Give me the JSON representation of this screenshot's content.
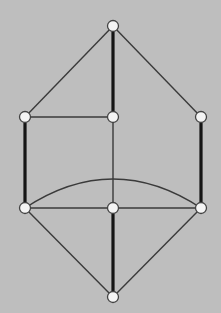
{
  "diagram": {
    "type": "graph",
    "background": "#bebebe",
    "node_radius": 5.5,
    "nodes": [
      {
        "id": "top",
        "x": 113,
        "y": 26
      },
      {
        "id": "left_mid",
        "x": 25,
        "y": 117
      },
      {
        "id": "center_mid",
        "x": 113,
        "y": 117
      },
      {
        "id": "right_mid",
        "x": 201,
        "y": 117
      },
      {
        "id": "left_low",
        "x": 25,
        "y": 208
      },
      {
        "id": "center_low",
        "x": 113,
        "y": 208
      },
      {
        "id": "right_low",
        "x": 201,
        "y": 208
      },
      {
        "id": "bottom",
        "x": 113,
        "y": 297
      }
    ],
    "edges": [
      {
        "from": "top",
        "to": "left_mid",
        "weight": "thin"
      },
      {
        "from": "top",
        "to": "right_mid",
        "weight": "thin"
      },
      {
        "from": "top",
        "to": "center_mid",
        "weight": "thick"
      },
      {
        "from": "left_mid",
        "to": "center_mid",
        "weight": "thin"
      },
      {
        "from": "center_mid",
        "to": "center_low",
        "weight": "thin"
      },
      {
        "from": "left_mid",
        "to": "left_low",
        "weight": "thick"
      },
      {
        "from": "right_mid",
        "to": "right_low",
        "weight": "thick"
      },
      {
        "from": "left_low",
        "to": "center_low",
        "weight": "thin"
      },
      {
        "from": "center_low",
        "to": "right_low",
        "weight": "thin"
      },
      {
        "from": "left_low",
        "to": "bottom",
        "weight": "thin"
      },
      {
        "from": "right_low",
        "to": "bottom",
        "weight": "thin"
      },
      {
        "from": "center_low",
        "to": "bottom",
        "weight": "thick"
      }
    ],
    "arcs": [
      {
        "from": "left_low",
        "to": "right_low",
        "peak_y": 179,
        "weight": "thin"
      }
    ]
  }
}
